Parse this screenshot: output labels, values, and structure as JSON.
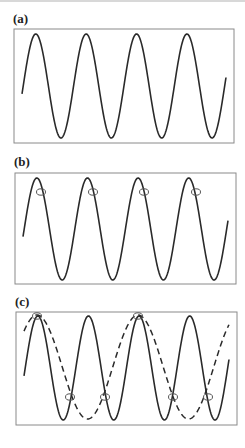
{
  "figure": {
    "panels": [
      {
        "id": "a",
        "label": "(a)",
        "description": "Continuous sine wave, 4 cycles",
        "box": {
          "x": 14,
          "y": 29,
          "w": 220,
          "h": 114
        },
        "solid_wave": {
          "cycles": 4
        },
        "markers": []
      },
      {
        "id": "b",
        "label": "(b)",
        "description": "Same sine wave sampled once per cycle (samples just past each peak)",
        "box": {
          "x": 15,
          "y": 173,
          "w": 221,
          "h": 111
        },
        "solid_wave": {
          "cycles": 4
        },
        "markers": [
          "sample-1",
          "sample-2",
          "sample-3",
          "sample-4"
        ]
      },
      {
        "id": "c",
        "label": "(c)",
        "description": "Sine wave (solid) with alias wave (dashed) fitted through sample points",
        "box": {
          "x": 16,
          "y": 312,
          "w": 221,
          "h": 113
        },
        "solid_wave": {
          "cycles": 4
        },
        "dashed_wave": {
          "cycles": 2
        },
        "markers": [
          "peak-sample-1",
          "peak-sample-2",
          "cross-sample-1",
          "cross-sample-2",
          "cross-sample-3",
          "cross-sample-4"
        ]
      }
    ],
    "colors": {
      "line": "#2a2a2a",
      "box": "#8a8a8a",
      "marker": "#555555",
      "background": "#ffffff"
    }
  }
}
